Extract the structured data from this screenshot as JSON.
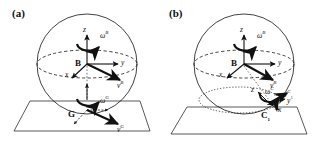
{
  "figure": {
    "width": 314,
    "height": 142,
    "background": "#ffffff",
    "stroke_color": "#111111"
  },
  "panels": [
    {
      "tag": "(a)",
      "tag_name": "panel-label-a",
      "sphere": {
        "cx": 87,
        "cy": 64,
        "r": 50,
        "equator_style": "dashed"
      },
      "ground_plane": {
        "style": "solid outline parallelogram",
        "tangent": true
      },
      "frames": [
        {
          "origin_label": "B",
          "origin_name": "point-b",
          "axes": [
            {
              "label": "z",
              "direction": "up"
            },
            {
              "label": "y",
              "direction": "right"
            },
            {
              "label": "x",
              "direction": "down-left"
            }
          ],
          "angular_velocity": {
            "symbol": "ω",
            "superscript": "B"
          },
          "linear_velocity": {
            "symbol": "v",
            "superscript": "B"
          }
        },
        {
          "origin_label": "G",
          "origin_name": "point-g",
          "axes": [],
          "angular_velocity": {
            "symbol": "ω",
            "superscript": "G"
          },
          "linear_velocity": {
            "symbol": "v",
            "superscript": "G"
          }
        }
      ]
    },
    {
      "tag": "(b)",
      "tag_name": "panel-label-b",
      "sphere": {
        "cx": 87,
        "cy": 64,
        "r": 50,
        "equator_style": "dashed"
      },
      "ground_plane": {
        "style": "solid outline parallelogram",
        "tangent": false
      },
      "latitude_circle": {
        "style": "dotted",
        "cx": 82,
        "cy": 100,
        "rx": 40,
        "ry": 13
      },
      "frames": [
        {
          "origin_label": "B",
          "origin_name": "point-b",
          "axes": [
            {
              "label": "z",
              "direction": "up"
            },
            {
              "label": "y",
              "direction": "right"
            },
            {
              "label": "x",
              "direction": "down-left"
            }
          ],
          "angular_velocity": {
            "symbol": "ω",
            "superscript": "B"
          },
          "linear_velocity": {
            "symbol": "v",
            "superscript": "B"
          }
        },
        {
          "origin_label": "C",
          "origin_subscript": "1",
          "origin_name": "point-c1",
          "axes": [
            {
              "label": "z",
              "direction": "up-left"
            },
            {
              "label": "y",
              "direction": "right"
            },
            {
              "label": "x",
              "direction": "down-right"
            }
          ],
          "angular_velocity": {
            "symbol": "ω",
            "superscript": "C",
            "sup_subscript": "1"
          },
          "linear_velocity": {
            "symbol": "v",
            "superscript": "C",
            "sup_subscript": "1"
          }
        }
      ]
    }
  ],
  "labels": {
    "panel_a_tag": "(a)",
    "panel_b_tag": "(b)",
    "point_b": "B",
    "point_g": "G",
    "point_c": "C",
    "point_c_sub": "1",
    "axis_x": "x",
    "axis_y": "y",
    "axis_z": "z",
    "omega": "ω",
    "v": "v",
    "sup_b": "B",
    "sup_g": "G",
    "sup_c": "C",
    "sup_c_sub": "1"
  }
}
